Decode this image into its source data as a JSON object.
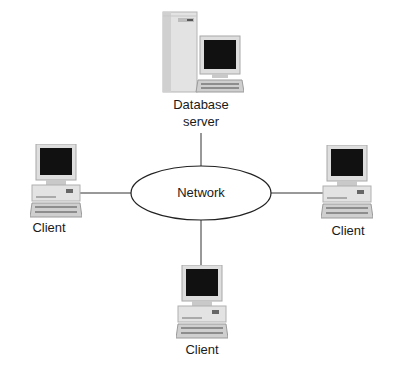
{
  "diagram": {
    "type": "network-topology",
    "hub": {
      "label": "Network",
      "shape": "ellipse"
    },
    "nodes": [
      {
        "id": "db",
        "label_line1": "Database",
        "label_line2": "server",
        "kind": "server-with-monitor"
      },
      {
        "id": "left",
        "label": "Client",
        "kind": "desktop-computer"
      },
      {
        "id": "right",
        "label": "Client",
        "kind": "desktop-computer"
      },
      {
        "id": "bottom",
        "label": "Client",
        "kind": "desktop-computer"
      }
    ],
    "edges": [
      [
        "db",
        "Network"
      ],
      [
        "left",
        "Network"
      ],
      [
        "right",
        "Network"
      ],
      [
        "bottom",
        "Network"
      ]
    ],
    "colors": {
      "line": "#333333",
      "screen": "#111111",
      "case": "#d9d9d9",
      "case_shadow": "#a8a8a8"
    }
  }
}
